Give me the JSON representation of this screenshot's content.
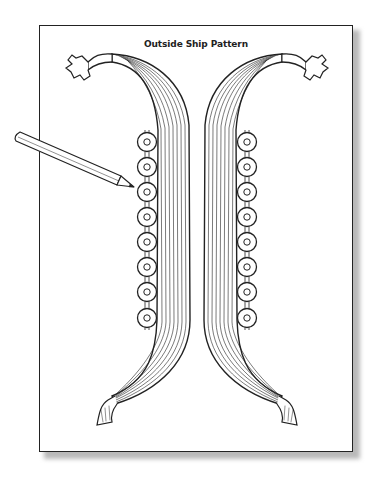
{
  "page": {
    "title": "Outside Ship Pattern"
  },
  "illustration": {
    "hull_halves": [
      "left",
      "right"
    ],
    "shields_per_side": 8,
    "pencil": "pointing-at-third-shield"
  },
  "colors": {
    "ink": "#222222",
    "paper": "#ffffff",
    "shadow": "#b9b9b9"
  }
}
